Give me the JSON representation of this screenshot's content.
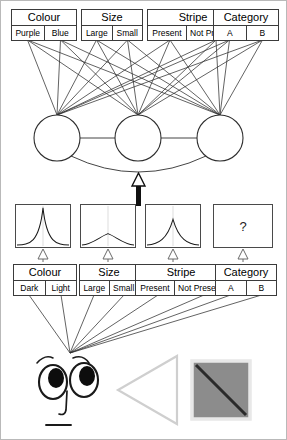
{
  "diagram": {
    "ink_color": "#3b3b3b",
    "accent_gray": "#9b9b9b",
    "fill_gray": "#8c8c8c"
  },
  "top_features": [
    {
      "name": "colour",
      "label": "Colour",
      "values": [
        "Purple",
        "Blue"
      ],
      "x": 10,
      "y": 8,
      "w": 66
    },
    {
      "name": "size",
      "label": "Size",
      "values": [
        "Large",
        "Small"
      ],
      "x": 80,
      "y": 8,
      "w": 62
    },
    {
      "name": "stripe",
      "label": "Stripe",
      "values": [
        "Present",
        "Not Present"
      ],
      "x": 146,
      "y": 8,
      "w": 92
    },
    {
      "name": "category",
      "label": "Category",
      "values": [
        "A",
        "B"
      ],
      "x": 212,
      "y": 8,
      "w": 66
    }
  ],
  "bottom_features": [
    {
      "name": "colour",
      "label": "Colour",
      "values": [
        "Dark",
        "Light"
      ],
      "x": 12,
      "y": 263,
      "w": 64
    },
    {
      "name": "size",
      "label": "Size",
      "values": [
        "Large",
        "Small"
      ],
      "x": 78,
      "y": 263,
      "w": 60
    },
    {
      "name": "stripe",
      "label": "Stripe",
      "values": [
        "Present",
        "Not Present"
      ],
      "x": 134,
      "y": 263,
      "w": 92
    },
    {
      "name": "category",
      "label": "Category",
      "values": [
        "A",
        "B"
      ],
      "x": 214,
      "y": 263,
      "w": 62
    }
  ],
  "hidden_units": [
    {
      "name": "hidden-node-1",
      "cx": 56,
      "cy": 137,
      "r": 23
    },
    {
      "name": "hidden-node-2",
      "cx": 137,
      "cy": 137,
      "r": 23
    },
    {
      "name": "hidden-node-3",
      "cx": 219,
      "cy": 137,
      "r": 23
    }
  ],
  "plots": [
    {
      "name": "plot-colour",
      "x": 14,
      "y": 203,
      "w": 56,
      "h": 44,
      "kind": "curve",
      "peak": "sharp",
      "peak_height": 0.93,
      "spread": 0.1
    },
    {
      "name": "plot-size",
      "x": 79,
      "y": 203,
      "w": 56,
      "h": 44,
      "kind": "curve",
      "peak": "flat",
      "peak_height": 0.33,
      "spread": 0.45
    },
    {
      "name": "plot-stripe",
      "x": 144,
      "y": 203,
      "w": 56,
      "h": 44,
      "kind": "curve",
      "peak": "medium",
      "peak_height": 0.62,
      "spread": 0.2
    },
    {
      "name": "plot-category",
      "x": 212,
      "y": 203,
      "w": 60,
      "h": 44,
      "kind": "unknown",
      "symbol": "?"
    }
  ],
  "arrow": {
    "name": "upward-inference-arrow",
    "x": 138,
    "y_top": 178,
    "y_bottom": 205
  },
  "stimulus": {
    "face": {
      "name": "observer-face",
      "description": "cartoon face looking left"
    },
    "triangle": {
      "name": "triangle-shape",
      "description": "left pointing triangle outline",
      "color": "#cfcfcf"
    },
    "square": {
      "name": "textured-square",
      "description": "gray square with diagonal stripe",
      "fill": "#8c8c8c",
      "border": "#e8e8e8",
      "diagonal": "#2a2a2a"
    }
  }
}
